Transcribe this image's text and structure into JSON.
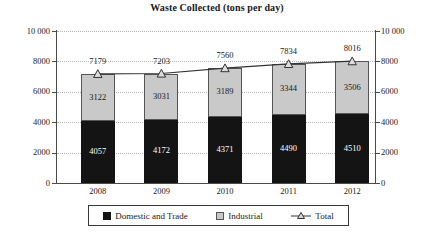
{
  "chart_data": {
    "type": "bar",
    "subtype": "stacked-bar-with-line-overlay",
    "title": "Waste Collected (tons per day)",
    "xlabel": "",
    "ylabel": "",
    "categories": [
      "2008",
      "2009",
      "2010",
      "2011",
      "2012"
    ],
    "series": [
      {
        "name": "Domestic and Trade",
        "values": [
          4057,
          4172,
          4371,
          4490,
          4510
        ],
        "color": "#141414",
        "render": "bar-segment-bottom"
      },
      {
        "name": "Industrial",
        "values": [
          3122,
          3031,
          3189,
          3344,
          3506
        ],
        "color": "#c9c9c9",
        "render": "bar-segment-top"
      },
      {
        "name": "Total",
        "values": [
          7179,
          7203,
          7560,
          7834,
          8016
        ],
        "color": "#333333",
        "render": "line-with-triangle-markers"
      }
    ],
    "ylim": [
      0,
      10000
    ],
    "ytick_values": [
      0,
      2000,
      4000,
      6000,
      8000,
      10000
    ],
    "ytick_labels_left": [
      "0",
      "2000",
      "4000",
      "6000",
      "8000",
      "10 000"
    ],
    "ytick_labels_right": [
      "0",
      "2000",
      "4000",
      "6000",
      "8000",
      "10 000"
    ],
    "dual_axis": true,
    "grid": true,
    "grid_style": "dotted",
    "legend_position": "bottom",
    "data_labels": true
  },
  "legend": {
    "items": [
      {
        "label": "Domestic and Trade",
        "marker": "black-square-icon"
      },
      {
        "label": "Industrial",
        "marker": "gray-square-icon"
      },
      {
        "label": "Total",
        "marker": "line-triangle-icon"
      }
    ]
  }
}
